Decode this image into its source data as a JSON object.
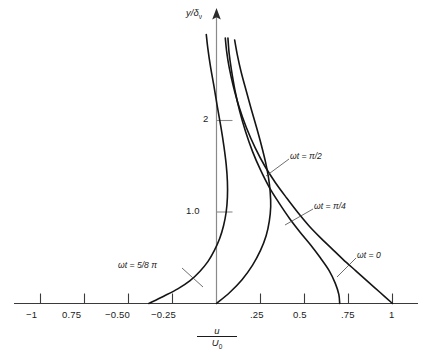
{
  "chart_data": {
    "type": "line",
    "title": "",
    "xlabel": "u/U0",
    "ylabel": "y/δν",
    "xlim": [
      -1.12,
      1.1
    ],
    "ylim": [
      0,
      3.05
    ],
    "grid": false,
    "legend_position": "inline-annotations",
    "x_ticks": [
      {
        "value": -1.0,
        "label": "−1"
      },
      {
        "value": -0.75,
        "label": "0.75"
      },
      {
        "value": -0.5,
        "label": "−0.50"
      },
      {
        "value": -0.25,
        "label": "−0.25"
      },
      {
        "value": 0.25,
        "label": ".25"
      },
      {
        "value": 0.5,
        "label": "0.5"
      },
      {
        "value": 0.75,
        "label": ".75"
      },
      {
        "value": 1.0,
        "label": "1"
      }
    ],
    "y_ticks": [
      {
        "value": 1.0,
        "label": "1.0"
      },
      {
        "value": 2.0,
        "label": "2"
      }
    ],
    "series": [
      {
        "name": "ωt = 0",
        "label": "ωt = 0",
        "color": "#151515",
        "points": [
          [
            1.0,
            0.0
          ],
          [
            0.93,
            0.12
          ],
          [
            0.86,
            0.24
          ],
          [
            0.79,
            0.36
          ],
          [
            0.72,
            0.48
          ],
          [
            0.655,
            0.6
          ],
          [
            0.59,
            0.72
          ],
          [
            0.525,
            0.85
          ],
          [
            0.46,
            1.0
          ],
          [
            0.4,
            1.15
          ],
          [
            0.335,
            1.32
          ],
          [
            0.275,
            1.5
          ],
          [
            0.22,
            1.7
          ],
          [
            0.17,
            1.92
          ],
          [
            0.128,
            2.15
          ],
          [
            0.095,
            2.38
          ],
          [
            0.072,
            2.58
          ],
          [
            0.058,
            2.75
          ],
          [
            0.05,
            2.9
          ]
        ]
      },
      {
        "name": "ωt = π/4",
        "label": "ωt = π/4",
        "color": "#151515",
        "points": [
          [
            0.7,
            0.0
          ],
          [
            0.695,
            0.1
          ],
          [
            0.675,
            0.22
          ],
          [
            0.64,
            0.36
          ],
          [
            0.59,
            0.5
          ],
          [
            0.535,
            0.64
          ],
          [
            0.475,
            0.78
          ],
          [
            0.415,
            0.93
          ],
          [
            0.355,
            1.1
          ],
          [
            0.3,
            1.27
          ],
          [
            0.25,
            1.46
          ],
          [
            0.205,
            1.66
          ],
          [
            0.165,
            1.88
          ],
          [
            0.132,
            2.1
          ],
          [
            0.105,
            2.33
          ],
          [
            0.085,
            2.55
          ],
          [
            0.072,
            2.73
          ],
          [
            0.065,
            2.9
          ]
        ]
      },
      {
        "name": "ωt = π/2",
        "label": "ωt = π/2",
        "color": "#151515",
        "points": [
          [
            0.0,
            0.0
          ],
          [
            0.075,
            0.12
          ],
          [
            0.145,
            0.26
          ],
          [
            0.205,
            0.42
          ],
          [
            0.25,
            0.58
          ],
          [
            0.282,
            0.74
          ],
          [
            0.3,
            0.9
          ],
          [
            0.308,
            1.06
          ],
          [
            0.305,
            1.22
          ],
          [
            0.295,
            1.38
          ],
          [
            0.278,
            1.55
          ],
          [
            0.255,
            1.73
          ],
          [
            0.228,
            1.92
          ],
          [
            0.198,
            2.12
          ],
          [
            0.168,
            2.33
          ],
          [
            0.14,
            2.53
          ],
          [
            0.118,
            2.72
          ],
          [
            0.103,
            2.88
          ]
        ]
      },
      {
        "name": "ωt = 5/8 π",
        "label": "ωt = 5/8 π",
        "color": "#151515",
        "points": [
          [
            -0.385,
            0.0
          ],
          [
            -0.3,
            0.08
          ],
          [
            -0.22,
            0.16
          ],
          [
            -0.15,
            0.25
          ],
          [
            -0.095,
            0.35
          ],
          [
            -0.048,
            0.46
          ],
          [
            -0.012,
            0.58
          ],
          [
            0.018,
            0.71
          ],
          [
            0.04,
            0.85
          ],
          [
            0.055,
            1.0
          ],
          [
            0.062,
            1.16
          ],
          [
            0.062,
            1.33
          ],
          [
            0.055,
            1.52
          ],
          [
            0.042,
            1.72
          ],
          [
            0.025,
            1.93
          ],
          [
            0.005,
            2.15
          ],
          [
            -0.015,
            2.38
          ],
          [
            -0.035,
            2.6
          ],
          [
            -0.05,
            2.8
          ],
          [
            -0.058,
            2.94
          ]
        ]
      }
    ],
    "annotations": [
      {
        "text": "ωt = π/2",
        "x": 0.7,
        "y": 1.7
      },
      {
        "text": "ωt = π/4",
        "x": 0.79,
        "y": 1.03
      },
      {
        "text": "ωt = 0",
        "x": 1.02,
        "y": 0.47
      },
      {
        "text": "ωt = 5/8 π",
        "x": -0.58,
        "y": 0.47
      }
    ]
  },
  "axis": {
    "y_title_main": "y/δ",
    "y_title_sub": "ν",
    "x_title_numerator": "u",
    "x_title_denominator_main": "U",
    "x_title_denominator_sub": "0"
  },
  "curve_labels": {
    "pi_half": {
      "greek": "ω",
      "rest": "t = π/2"
    },
    "pi_quarter": {
      "greek": "ω",
      "rest": "t = π/4"
    },
    "zero": {
      "greek": "ω",
      "rest": "t = 0"
    },
    "five_eighths_pi": {
      "greek": "ω",
      "rest": "t = 5/8 π"
    }
  },
  "tick_labels": {
    "x": [
      "−1",
      "0.75",
      "−0.50",
      "−0.25",
      ".25",
      "0.5",
      ".75",
      "1"
    ],
    "y": [
      "2",
      "1.0"
    ]
  },
  "colors": {
    "curve": "#151515",
    "axis": "#3a3a3a",
    "text": "#1a1a1a",
    "background": "#ffffff"
  }
}
